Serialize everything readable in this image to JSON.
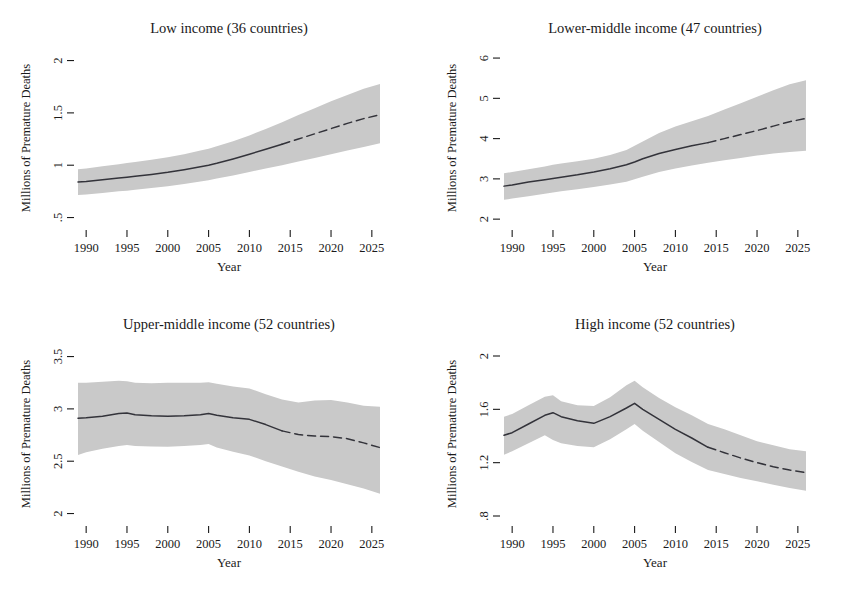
{
  "figure": {
    "background": "#ffffff",
    "band_color": "#c9c9c9",
    "line_color": "#33333a",
    "width": 852,
    "height": 591
  },
  "chart_data": [
    {
      "type": "line",
      "panel_id": "low-income",
      "title": "Low income (36 countries)",
      "xlabel": "Year",
      "ylabel": "Millions of Premature Deaths",
      "xlim": [
        1989,
        2026
      ],
      "ylim": [
        0.4,
        2.12
      ],
      "xticks": [
        1990,
        1995,
        2000,
        2005,
        2010,
        2015,
        2020,
        2025
      ],
      "xtick_labels": [
        "1990",
        "1995",
        "2000",
        "2005",
        "2010",
        "2015",
        "2020",
        "2025"
      ],
      "yticks": [
        0.5,
        1,
        1.5,
        2
      ],
      "ytick_labels": [
        ".5",
        "1",
        "1.5",
        "2"
      ],
      "grid": false,
      "legend": "none",
      "x": [
        1989,
        1990,
        1992,
        1994,
        1995,
        1996,
        1998,
        2000,
        2002,
        2004,
        2005,
        2006,
        2008,
        2010,
        2012,
        2014,
        2016,
        2018,
        2020,
        2022,
        2024,
        2026
      ],
      "series": [
        {
          "name": "Observed",
          "style": "solid",
          "x_range": [
            1989,
            2014
          ],
          "values": [
            0.84,
            0.845,
            0.862,
            0.878,
            0.886,
            0.894,
            0.912,
            0.932,
            0.957,
            0.985,
            1.0,
            1.018,
            1.06,
            1.105,
            1.152,
            1.2,
            null,
            null,
            null,
            null,
            null,
            null
          ]
        },
        {
          "name": "Projected",
          "style": "dashed",
          "x_range": [
            2014,
            2026
          ],
          "values": [
            null,
            null,
            null,
            null,
            null,
            null,
            null,
            null,
            null,
            null,
            null,
            null,
            null,
            null,
            null,
            1.2,
            1.25,
            1.3,
            1.35,
            1.4,
            1.445,
            1.482
          ]
        }
      ],
      "ci_band": {
        "name": "95% interval",
        "lower": [
          0.715,
          0.72,
          0.735,
          0.75,
          0.757,
          0.765,
          0.783,
          0.8,
          0.82,
          0.845,
          0.857,
          0.872,
          0.902,
          0.935,
          0.968,
          1.0,
          1.035,
          1.07,
          1.105,
          1.14,
          1.175,
          1.21
        ],
        "upper": [
          0.962,
          0.968,
          0.99,
          1.01,
          1.02,
          1.03,
          1.052,
          1.075,
          1.105,
          1.14,
          1.158,
          1.18,
          1.228,
          1.285,
          1.345,
          1.41,
          1.48,
          1.545,
          1.61,
          1.672,
          1.73,
          1.775
        ]
      }
    },
    {
      "type": "line",
      "panel_id": "lower-middle-income",
      "title": "Lower-middle income (47 countries)",
      "xlabel": "Year",
      "ylabel": "Millions of Premature Deaths",
      "xlim": [
        1989,
        2026
      ],
      "ylim": [
        1.78,
        6.25
      ],
      "xticks": [
        1990,
        1995,
        2000,
        2005,
        2010,
        2015,
        2020,
        2025
      ],
      "xtick_labels": [
        "1990",
        "1995",
        "2000",
        "2005",
        "2010",
        "2015",
        "2020",
        "2025"
      ],
      "yticks": [
        2,
        3,
        4,
        5,
        6
      ],
      "ytick_labels": [
        "2",
        "3",
        "4",
        "5",
        "6"
      ],
      "grid": false,
      "legend": "none",
      "x": [
        1989,
        1990,
        1992,
        1994,
        1995,
        1996,
        1998,
        2000,
        2002,
        2004,
        2005,
        2006,
        2008,
        2010,
        2012,
        2014,
        2016,
        2018,
        2020,
        2022,
        2024,
        2026
      ],
      "series": [
        {
          "name": "Observed",
          "style": "solid",
          "x_range": [
            1989,
            2014
          ],
          "values": [
            2.82,
            2.85,
            2.92,
            2.98,
            3.01,
            3.04,
            3.1,
            3.17,
            3.25,
            3.35,
            3.42,
            3.5,
            3.63,
            3.73,
            3.82,
            3.9,
            null,
            null,
            null,
            null,
            null,
            null
          ]
        },
        {
          "name": "Projected",
          "style": "dashed",
          "x_range": [
            2014,
            2026
          ],
          "values": [
            null,
            null,
            null,
            null,
            null,
            null,
            null,
            null,
            null,
            null,
            null,
            null,
            null,
            null,
            null,
            3.9,
            4.0,
            4.1,
            4.2,
            4.31,
            4.42,
            4.5
          ]
        }
      ],
      "ci_band": {
        "name": "95% interval",
        "lower": [
          2.48,
          2.51,
          2.57,
          2.63,
          2.66,
          2.69,
          2.74,
          2.8,
          2.86,
          2.93,
          2.99,
          3.05,
          3.17,
          3.26,
          3.33,
          3.4,
          3.46,
          3.52,
          3.58,
          3.63,
          3.67,
          3.7
        ],
        "upper": [
          3.14,
          3.17,
          3.24,
          3.31,
          3.35,
          3.38,
          3.44,
          3.5,
          3.59,
          3.72,
          3.82,
          3.93,
          4.14,
          4.3,
          4.43,
          4.56,
          4.72,
          4.88,
          5.04,
          5.2,
          5.35,
          5.45
        ]
      }
    },
    {
      "type": "line",
      "panel_id": "upper-middle-income",
      "title": "Upper-middle income (52 countries)",
      "xlabel": "Year",
      "ylabel": "Millions of Premature Deaths",
      "xlim": [
        1989,
        2026
      ],
      "ylim": [
        1.9,
        3.62
      ],
      "xticks": [
        1990,
        1995,
        2000,
        2005,
        2010,
        2015,
        2020,
        2025
      ],
      "xtick_labels": [
        "1990",
        "1995",
        "2000",
        "2005",
        "2010",
        "2015",
        "2020",
        "2025"
      ],
      "yticks": [
        2,
        2.5,
        3,
        3.5
      ],
      "ytick_labels": [
        "2",
        "2.5",
        "3",
        "3.5"
      ],
      "grid": false,
      "legend": "none",
      "x": [
        1989,
        1990,
        1992,
        1994,
        1995,
        1996,
        1998,
        2000,
        2002,
        2004,
        2005,
        2006,
        2008,
        2010,
        2012,
        2014,
        2016,
        2018,
        2020,
        2022,
        2024,
        2026
      ],
      "series": [
        {
          "name": "Observed",
          "style": "solid",
          "x_range": [
            1989,
            2014
          ],
          "values": [
            2.91,
            2.915,
            2.93,
            2.955,
            2.96,
            2.945,
            2.935,
            2.93,
            2.935,
            2.945,
            2.955,
            2.94,
            2.915,
            2.9,
            2.85,
            2.79,
            null,
            null,
            null,
            null,
            null,
            null
          ]
        },
        {
          "name": "Projected",
          "style": "dashed",
          "x_range": [
            2014,
            2026
          ],
          "values": [
            null,
            null,
            null,
            null,
            null,
            null,
            null,
            null,
            null,
            null,
            null,
            null,
            null,
            null,
            null,
            2.79,
            2.755,
            2.74,
            2.735,
            2.715,
            2.675,
            2.63
          ]
        }
      ],
      "ci_band": {
        "name": "95% interval",
        "lower": [
          2.56,
          2.585,
          2.62,
          2.645,
          2.655,
          2.645,
          2.64,
          2.638,
          2.645,
          2.655,
          2.665,
          2.63,
          2.59,
          2.555,
          2.5,
          2.45,
          2.4,
          2.355,
          2.32,
          2.28,
          2.24,
          2.19
        ],
        "upper": [
          3.25,
          3.25,
          3.26,
          3.27,
          3.265,
          3.25,
          3.245,
          3.25,
          3.25,
          3.25,
          3.255,
          3.24,
          3.215,
          3.195,
          3.14,
          3.09,
          3.06,
          3.08,
          3.085,
          3.06,
          3.03,
          3.02
        ]
      }
    },
    {
      "type": "line",
      "panel_id": "high-income",
      "title": "High income (52 countries)",
      "xlabel": "Year",
      "ylabel": "Millions of Premature Deaths",
      "xlim": [
        1989,
        2026
      ],
      "ylim": [
        0.74,
        2.09
      ],
      "xticks": [
        1990,
        1995,
        2000,
        2005,
        2010,
        2015,
        2020,
        2025
      ],
      "xtick_labels": [
        "1990",
        "1995",
        "2000",
        "2005",
        "2010",
        "2015",
        "2020",
        "2025"
      ],
      "yticks": [
        0.8,
        1.2,
        1.6,
        2
      ],
      "ytick_labels": [
        ".8",
        "1.2",
        "1.6",
        "2"
      ],
      "grid": false,
      "legend": "none",
      "x": [
        1989,
        1990,
        1992,
        1994,
        1995,
        1996,
        1998,
        2000,
        2002,
        2004,
        2005,
        2006,
        2008,
        2010,
        2012,
        2014,
        2016,
        2018,
        2020,
        2022,
        2024,
        2026
      ],
      "series": [
        {
          "name": "Observed",
          "style": "solid",
          "x_range": [
            1989,
            2014
          ],
          "values": [
            1.405,
            1.425,
            1.49,
            1.555,
            1.575,
            1.545,
            1.515,
            1.495,
            1.545,
            1.61,
            1.645,
            1.6,
            1.525,
            1.45,
            1.385,
            1.315,
            null,
            null,
            null,
            null,
            null,
            null
          ]
        },
        {
          "name": "Projected",
          "style": "dashed",
          "x_range": [
            2014,
            2026
          ],
          "values": [
            null,
            null,
            null,
            null,
            null,
            null,
            null,
            null,
            null,
            null,
            null,
            null,
            null,
            null,
            null,
            1.315,
            1.275,
            1.235,
            1.2,
            1.17,
            1.145,
            1.125
          ]
        }
      ],
      "ci_band": {
        "name": "95% interval",
        "lower": [
          1.26,
          1.285,
          1.345,
          1.405,
          1.37,
          1.345,
          1.325,
          1.315,
          1.375,
          1.45,
          1.49,
          1.44,
          1.355,
          1.27,
          1.205,
          1.145,
          1.115,
          1.085,
          1.06,
          1.035,
          1.01,
          0.99
        ],
        "upper": [
          1.545,
          1.565,
          1.63,
          1.695,
          1.705,
          1.66,
          1.63,
          1.625,
          1.69,
          1.78,
          1.815,
          1.765,
          1.685,
          1.615,
          1.555,
          1.49,
          1.45,
          1.405,
          1.36,
          1.33,
          1.3,
          1.285
        ]
      }
    }
  ]
}
